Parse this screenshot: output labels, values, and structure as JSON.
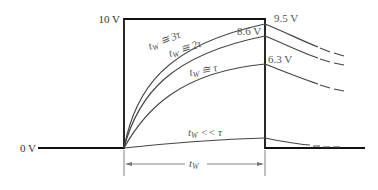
{
  "diagram": {
    "pulse": {
      "high_label": "10 V",
      "low_label": "0 V",
      "width_label": "t_W",
      "width_label_main": "t",
      "width_label_sub": "W"
    },
    "curves": [
      {
        "condition_main": "t",
        "condition_sub": "W",
        "condition_rel": " ≅ 3τ",
        "final_voltage": "9.5 V"
      },
      {
        "condition_main": "t",
        "condition_sub": "W",
        "condition_rel": " ≅ 2τ",
        "final_voltage": "8.6 V"
      },
      {
        "condition_main": "t",
        "condition_sub": "W",
        "condition_rel": " ≅ τ",
        "final_voltage": "6.3 V"
      },
      {
        "condition_main": "t",
        "condition_sub": "W",
        "condition_rel": " << τ",
        "final_voltage": ""
      }
    ],
    "colors": {
      "pulse": "#111111",
      "curve": "#444444",
      "dimension": "#777777",
      "label": "#555555"
    }
  }
}
